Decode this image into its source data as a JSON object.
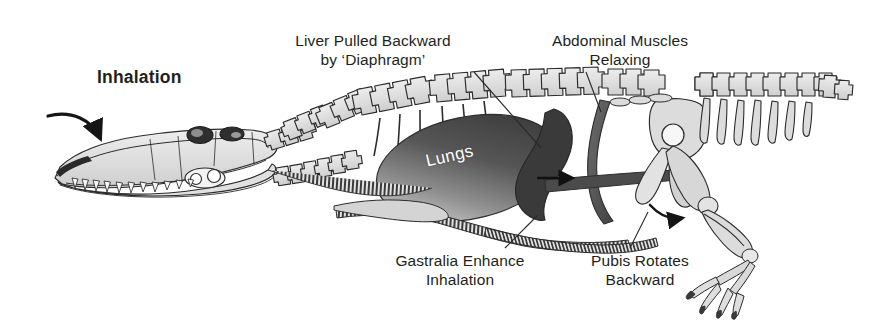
{
  "figure": {
    "title": "Inhalation",
    "background_color": "#ffffff",
    "ink_color": "#231f20"
  },
  "labels": {
    "inhalation": "Inhalation",
    "liver": "Liver Pulled Backward\nby ‘Diaphragm’",
    "abdominal": "Abdominal Muscles\nRelaxing",
    "gastralia": "Gastralia Enhance\nInhalation",
    "pubis": "Pubis Rotates\nBackward",
    "lungs": "Lungs"
  },
  "colors": {
    "bone_fill": "#dcdcdc",
    "bone_fill_light": "#ebebeb",
    "bone_outline": "#2b2b2b",
    "lung_dark": "#4a4a4a",
    "lung_light": "#b9b9b9",
    "liver_dark": "#3d3d3d",
    "muscle_dark": "#555555",
    "gastralia": "#4f4f4f",
    "arrow": "#1a1a1a",
    "text": "#231f20",
    "lung_text": "#ffffff"
  },
  "anatomy": {
    "skull": "crocodilian skull with teeth, orbit and fenestrae",
    "cervical_vertebrae": "neck vertebrae arcing from skull to trunk",
    "dorsal_vertebrae": "dorsal vertebral column with neural spines and ribs",
    "caudal_vertebrae": "tail vertebrae with neural spines and chevrons",
    "lungs": "large ellipse shaded dark-to-light",
    "liver": "dark curved mass behind the lungs",
    "abdominal_muscles": "dark band from vertebral column to gastralia",
    "gastralia": "striped belly ribs along the ventral margin",
    "pelvis": "ilium, pubis and ischium",
    "hind_limb": "femur, tibia, fibula and four-toed foot with claws"
  },
  "arrows": [
    {
      "name": "inhalation-airflow-arrow",
      "description": "curved arrow into the snout",
      "direction": "down-right"
    },
    {
      "name": "liver-motion-arrow",
      "description": "straight arrow behind liver",
      "direction": "right"
    },
    {
      "name": "pubis-rotation-arrow",
      "description": "curved arrow at the pubis",
      "direction": "right-down"
    }
  ],
  "leader_lines": [
    {
      "name": "liver-leader",
      "from_label": "liver",
      "to": "liver mass"
    },
    {
      "name": "abdominal-leader",
      "from_label": "abdominal",
      "to": "abdominal muscle band"
    },
    {
      "name": "gastralia-leader",
      "from_label": "gastralia",
      "to": "gastralia band"
    },
    {
      "name": "pubis-leader",
      "from_label": "pubis",
      "to": "pubis rotation arrow"
    }
  ]
}
